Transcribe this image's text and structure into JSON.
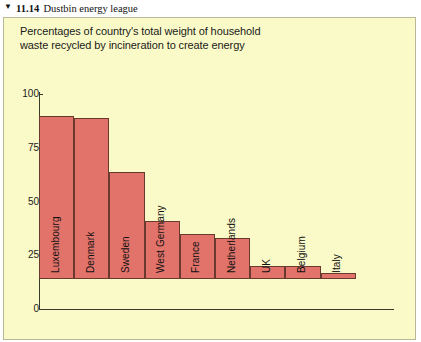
{
  "figure": {
    "marker_icon": "triangle-down-icon",
    "marker_glyph": "▼",
    "number": "11.14",
    "caption": "Dustbin energy league"
  },
  "chart_panel": {
    "background_color": "#fafac8",
    "border_color": "#b9b99a",
    "bar_color": "#e2736a",
    "bar_border_color": "#6b3a2e",
    "axis_color": "#3a3a28"
  },
  "chart_data": {
    "type": "bar",
    "title": "Percentages of country's total weight of household waste recycled by incineration to create energy",
    "title_line_1": "Percentages of country's total weight of household",
    "title_line_2": "waste recycled by incineration to create energy",
    "xlabel": "",
    "ylabel": "",
    "ylim": [
      0,
      100
    ],
    "yticks": [
      0,
      25,
      50,
      75,
      100
    ],
    "ytick_labels": [
      "0",
      "25",
      "50",
      "75",
      "100"
    ],
    "grid": false,
    "legend": false,
    "categories": [
      "Luxembourg",
      "Denmark",
      "Sweden",
      "West Germany",
      "France",
      "Netherlands",
      "UK",
      "Belgium",
      "Italy"
    ],
    "values": [
      76,
      75,
      50,
      27,
      21,
      19,
      6,
      6,
      3
    ],
    "series": [
      {
        "name": "Percentage of household waste incinerated for energy",
        "values": [
          76,
          75,
          50,
          27,
          21,
          19,
          6,
          6,
          3
        ]
      }
    ],
    "bar_labels_rotated": true
  }
}
